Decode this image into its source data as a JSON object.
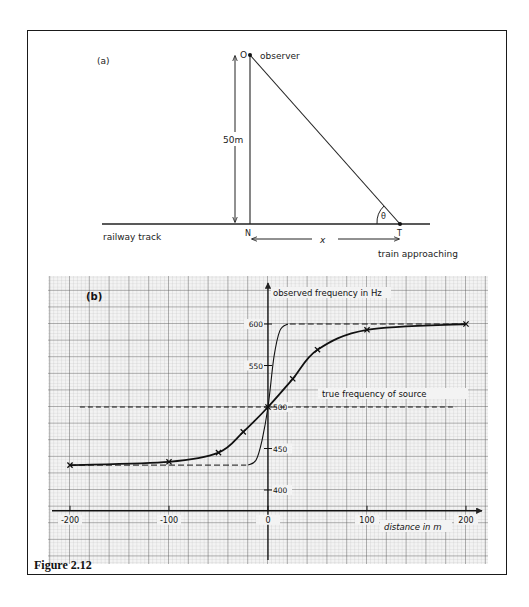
{
  "figure": {
    "caption": "Figure 2.12",
    "part_a": {
      "label": "(a)",
      "point_O": "O",
      "observer_label": "observer",
      "height_label": "50m",
      "point_N": "N",
      "point_T": "T",
      "angle_label": "θ",
      "distance_label": "x",
      "track_label": "railway track",
      "train_label": "train approaching"
    },
    "part_b": {
      "label": "(b)",
      "reference_label": "true frequency of source"
    }
  },
  "chart_data": {
    "type": "line",
    "title": "(b)",
    "xlabel": "distance in m",
    "ylabel": "observed frequency in Hz",
    "xlim": [
      -200,
      200
    ],
    "ylim": [
      375,
      625
    ],
    "x_ticks": [
      -200,
      -100,
      0,
      100,
      200
    ],
    "x_tick_labels": [
      "-200",
      "-100",
      "0",
      "100",
      "200"
    ],
    "y_ticks": [
      400,
      450,
      500,
      550,
      600
    ],
    "y_tick_labels": [
      "400",
      "450",
      "500",
      "550",
      "600"
    ],
    "grid": true,
    "legend": null,
    "series": [
      {
        "name": "observed frequency (50 m from track)",
        "style": "solid with x markers",
        "x": [
          -200,
          -100,
          -50,
          -25,
          0,
          25,
          50,
          100,
          200
        ],
        "y": [
          430,
          434,
          445,
          470,
          500,
          534,
          569,
          593,
          600
        ]
      },
      {
        "name": "observed frequency (close to track)",
        "style": "thin solid, dashed asymptotes",
        "x": [
          -200,
          -20,
          -12,
          -6,
          0,
          6,
          12,
          20,
          200
        ],
        "y": [
          430,
          430,
          436,
          460,
          500,
          560,
          592,
          600,
          600
        ]
      },
      {
        "name": "true frequency of source",
        "style": "dashed",
        "x": [
          -190,
          190
        ],
        "y": [
          500,
          500
        ]
      }
    ]
  }
}
